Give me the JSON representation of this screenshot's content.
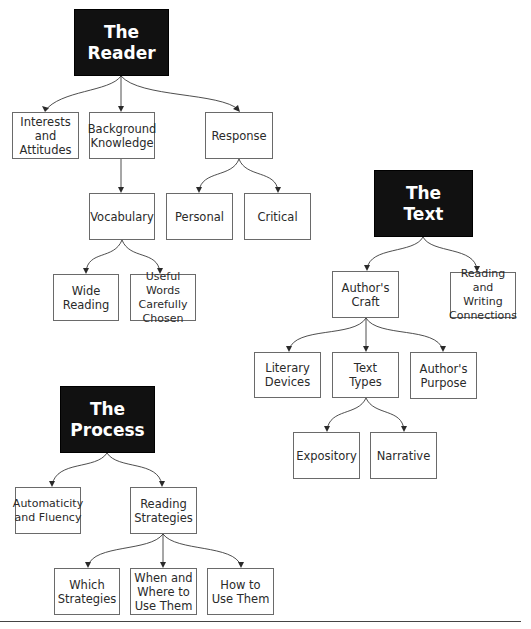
{
  "diagram": {
    "trees": [
      {
        "name": "reader",
        "root": {
          "label": "The\nReader",
          "box": [
            74,
            9,
            95,
            67
          ]
        },
        "children": [
          {
            "label": "Interests\nand\nAttitudes",
            "box": [
              12,
              112,
              67,
              47
            ]
          },
          {
            "label": "Background\nKnowledge",
            "box": [
              89,
              112,
              66,
              47
            ]
          },
          {
            "label": "Response",
            "box": [
              205,
              112,
              68,
              47
            ]
          },
          {
            "label": "Vocabulary",
            "box": [
              89,
              193,
              66,
              47
            ]
          },
          {
            "label": "Personal",
            "box": [
              166,
              193,
              67,
              47
            ]
          },
          {
            "label": "Critical",
            "box": [
              244,
              193,
              67,
              47
            ]
          },
          {
            "label": "Wide\nReading",
            "box": [
              53,
              274,
              66,
              47
            ]
          },
          {
            "label": "Useful Words\nCarefully\nChosen",
            "box": [
              130,
              274,
              66,
              47
            ]
          }
        ]
      },
      {
        "name": "text",
        "root": {
          "label": "The\nText",
          "box": [
            374,
            170,
            99,
            67
          ]
        },
        "children": [
          {
            "label": "Author's\nCraft",
            "box": [
              332,
              271,
              67,
              47
            ]
          },
          {
            "label": "Reading and\nWriting\nConnections",
            "box": [
              450,
              272,
              66,
              46
            ]
          },
          {
            "label": "Literary\nDevices",
            "box": [
              254,
              352,
              67,
              46
            ]
          },
          {
            "label": "Text\nTypes",
            "box": [
              332,
              352,
              67,
              46
            ]
          },
          {
            "label": "Author's\nPurpose",
            "box": [
              410,
              352,
              67,
              47
            ]
          },
          {
            "label": "Expository",
            "box": [
              293,
              432,
              67,
              47
            ]
          },
          {
            "label": "Narrative",
            "box": [
              370,
              432,
              67,
              47
            ]
          }
        ]
      },
      {
        "name": "process",
        "root": {
          "label": "The\nProcess",
          "box": [
            60,
            386,
            95,
            67
          ]
        },
        "children": [
          {
            "label": "Automaticity\nand Fluency",
            "box": [
              15,
              487,
              66,
              47
            ]
          },
          {
            "label": "Reading\nStrategies",
            "box": [
              130,
              487,
              67,
              47
            ]
          },
          {
            "label": "Which\nStrategies",
            "box": [
              54,
              568,
              66,
              47
            ]
          },
          {
            "label": "When and\nWhere to\nUse Them",
            "box": [
              130,
              568,
              67,
              47
            ]
          },
          {
            "label": "How to\nUse Them",
            "box": [
              207,
              568,
              67,
              47
            ]
          }
        ]
      }
    ],
    "nodes": {
      "reader": "The\nReader",
      "interests": "Interests\nand\nAttitudes",
      "background": "Background\nKnowledge",
      "response": "Response",
      "vocabulary": "Vocabulary",
      "personal": "Personal",
      "critical": "Critical",
      "wide_reading": "Wide\nReading",
      "useful_words": "Useful Words\nCarefully\nChosen",
      "text": "The\nText",
      "authors_craft": "Author's\nCraft",
      "rw_connections": "Reading and\nWriting\nConnections",
      "literary_devices": "Literary\nDevices",
      "text_types": "Text\nTypes",
      "authors_purpose": "Author's\nPurpose",
      "expository": "Expository",
      "narrative": "Narrative",
      "process": "The\nProcess",
      "automaticity": "Automaticity\nand Fluency",
      "reading_strategies": "Reading\nStrategies",
      "which_strategies": "Which\nStrategies",
      "when_where": "When and\nWhere to\nUse Them",
      "how_to_use": "How to\nUse Them"
    },
    "edges": [
      [
        "reader",
        "interests"
      ],
      [
        "reader",
        "background"
      ],
      [
        "reader",
        "response"
      ],
      [
        "background",
        "vocabulary"
      ],
      [
        "response",
        "personal"
      ],
      [
        "response",
        "critical"
      ],
      [
        "vocabulary",
        "wide_reading"
      ],
      [
        "vocabulary",
        "useful_words"
      ],
      [
        "text",
        "authors_craft"
      ],
      [
        "text",
        "rw_connections"
      ],
      [
        "authors_craft",
        "literary_devices"
      ],
      [
        "authors_craft",
        "text_types"
      ],
      [
        "authors_craft",
        "authors_purpose"
      ],
      [
        "text_types",
        "expository"
      ],
      [
        "text_types",
        "narrative"
      ],
      [
        "process",
        "automaticity"
      ],
      [
        "process",
        "reading_strategies"
      ],
      [
        "reading_strategies",
        "which_strategies"
      ],
      [
        "reading_strategies",
        "when_where"
      ],
      [
        "reading_strategies",
        "how_to_use"
      ]
    ],
    "colors": {
      "root_fill": "#111111",
      "root_text": "#ffffff",
      "box_border": "#6a6a6a",
      "line": "#3a3a3a"
    }
  }
}
